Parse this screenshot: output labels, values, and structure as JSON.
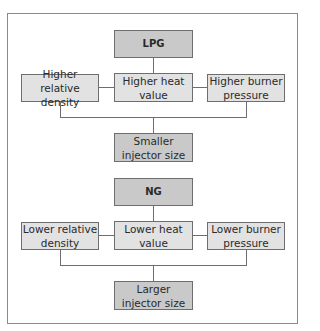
{
  "diagram": {
    "sections": [
      {
        "source": "LPG",
        "factors": [
          "Higher relative density",
          "Higher heat value",
          "Higher burner pressure"
        ],
        "result": "Smaller injector size"
      },
      {
        "source": "NG",
        "factors": [
          "Lower relative density",
          "Lower heat value",
          "Lower burner pressure"
        ],
        "result": "Larger injector size"
      }
    ],
    "colors": {
      "source_fill": "#c9c9c9",
      "factor_fill": "#e2e2e2",
      "result_fill": "#c9c9c9",
      "border": "#6e6e6e"
    }
  },
  "lpg": {
    "title": "LPG",
    "left_1": "Higher relative",
    "left_2": "density",
    "mid_1": "Higher heat",
    "mid_2": "value",
    "right_1": "Higher burner",
    "right_2": "pressure",
    "result_1": "Smaller",
    "result_2": "injector size"
  },
  "ng": {
    "title": "NG",
    "left_1": "Lower relative",
    "left_2": "density",
    "mid_1": "Lower heat",
    "mid_2": "value",
    "right_1": "Lower burner",
    "right_2": "pressure",
    "result_1": "Larger",
    "result_2": "injector size"
  }
}
